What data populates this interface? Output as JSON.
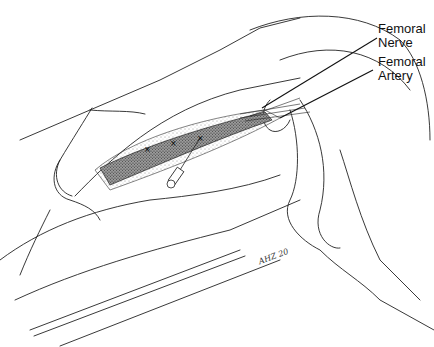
{
  "figure": {
    "labels": [
      {
        "id": "femoral-nerve",
        "line1": "Femoral",
        "line2": "Nerve"
      },
      {
        "id": "femoral-artery",
        "line1": "Femoral",
        "line2": "Artery"
      }
    ],
    "injection_marks": [
      "×",
      "×",
      "×"
    ],
    "signature": "AHZ 20"
  }
}
